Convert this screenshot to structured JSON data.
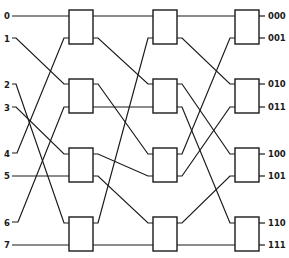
{
  "diagram": {
    "type": "3-stage shuffle-exchange switching network",
    "inputs": [
      "0",
      "1",
      "2",
      "3",
      "4",
      "5",
      "6",
      "7"
    ],
    "outputs": [
      "000",
      "001",
      "010",
      "011",
      "100",
      "101",
      "110",
      "111"
    ],
    "stages": 3,
    "switches_per_stage": 4,
    "colors": {
      "line": "#1a1a1a",
      "background": "#ffffff"
    },
    "connections": {
      "inputs_to_stage1": [
        {
          "input": "0",
          "to": "S1-1-top"
        },
        {
          "input": "1",
          "to": "S1-2-top"
        },
        {
          "input": "2",
          "to": "S1-4-top"
        },
        {
          "input": "3",
          "to": "S1-3-top"
        },
        {
          "input": "4",
          "to": "S1-1-bottom"
        },
        {
          "input": "5",
          "to": "S1-3-bottom"
        },
        {
          "input": "6",
          "to": "S1-2-bottom"
        },
        {
          "input": "7",
          "to": "S1-4-bottom"
        }
      ],
      "stage1_to_stage2": [
        {
          "from": "S1-1-top",
          "to": "S2-1-top"
        },
        {
          "from": "S1-1-bottom",
          "to": "S2-2-top"
        },
        {
          "from": "S1-2-top",
          "to": "S2-3-top"
        },
        {
          "from": "S1-2-bottom",
          "to": "S2-2-bottom"
        },
        {
          "from": "S1-3-top",
          "to": "S2-3-bottom"
        },
        {
          "from": "S1-3-bottom",
          "to": "S2-4-top"
        },
        {
          "from": "S1-4-top",
          "to": "S2-1-bottom"
        },
        {
          "from": "S1-4-bottom",
          "to": "S2-4-bottom"
        }
      ],
      "stage2_to_stage3": [
        {
          "from": "S2-1-top",
          "to": "S3-1-top"
        },
        {
          "from": "S2-1-bottom",
          "to": "S3-2-top"
        },
        {
          "from": "S2-2-top",
          "to": "S3-3-top"
        },
        {
          "from": "S2-2-bottom",
          "to": "S3-4-top"
        },
        {
          "from": "S2-3-top",
          "to": "S3-1-bottom"
        },
        {
          "from": "S2-3-bottom",
          "to": "S3-2-bottom"
        },
        {
          "from": "S2-4-top",
          "to": "S3-3-bottom"
        },
        {
          "from": "S2-4-bottom",
          "to": "S3-4-bottom"
        }
      ]
    }
  }
}
